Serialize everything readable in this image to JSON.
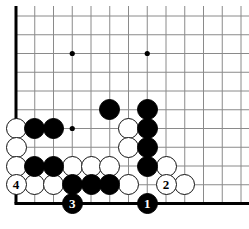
{
  "diagram": {
    "board": {
      "origin_x": 16,
      "origin_y": 16,
      "spacing": 18.75,
      "cols": 13,
      "rows": 11,
      "stone_diameter": 21,
      "edge_color": "#000000",
      "grid_color": "#8a8a8a",
      "background_color": "#ffffff",
      "black_color": "#000000",
      "white_color": "#ffffff",
      "edges": {
        "left": true,
        "bottom": true,
        "top": false,
        "right": false
      }
    },
    "star_points": [
      {
        "col": 3,
        "row": 2
      },
      {
        "col": 7,
        "row": 2
      },
      {
        "col": 3,
        "row": 6
      },
      {
        "col": 7,
        "row": 6
      }
    ],
    "stones": [
      {
        "color": "black",
        "col": 5,
        "row": 5
      },
      {
        "color": "black",
        "col": 7,
        "row": 5
      },
      {
        "color": "black",
        "col": 7,
        "row": 6
      },
      {
        "color": "black",
        "col": 7,
        "row": 7
      },
      {
        "color": "black",
        "col": 7,
        "row": 8
      },
      {
        "color": "black",
        "col": 1,
        "row": 6
      },
      {
        "color": "black",
        "col": 2,
        "row": 6
      },
      {
        "color": "black",
        "col": 1,
        "row": 8
      },
      {
        "color": "black",
        "col": 2,
        "row": 8
      },
      {
        "color": "black",
        "col": 3,
        "row": 9
      },
      {
        "color": "black",
        "col": 4,
        "row": 9
      },
      {
        "color": "black",
        "col": 5,
        "row": 9
      },
      {
        "color": "white",
        "col": 0,
        "row": 6
      },
      {
        "color": "white",
        "col": 0,
        "row": 7
      },
      {
        "color": "white",
        "col": 0,
        "row": 8
      },
      {
        "color": "white",
        "col": 6,
        "row": 6
      },
      {
        "color": "white",
        "col": 6,
        "row": 7
      },
      {
        "color": "white",
        "col": 3,
        "row": 8
      },
      {
        "color": "white",
        "col": 4,
        "row": 8
      },
      {
        "color": "white",
        "col": 5,
        "row": 8
      },
      {
        "color": "white",
        "col": 8,
        "row": 8
      },
      {
        "color": "white",
        "col": 1,
        "row": 9
      },
      {
        "color": "white",
        "col": 2,
        "row": 9
      },
      {
        "color": "white",
        "col": 6,
        "row": 9
      },
      {
        "color": "white",
        "col": 9,
        "row": 9
      }
    ],
    "numbered_moves": [
      {
        "number": "1",
        "color": "black",
        "col": 7,
        "row": 10
      },
      {
        "number": "2",
        "color": "white",
        "col": 8,
        "row": 9
      },
      {
        "number": "3",
        "color": "black",
        "col": 3,
        "row": 10
      },
      {
        "number": "4",
        "color": "white",
        "col": 0,
        "row": 9
      }
    ]
  }
}
